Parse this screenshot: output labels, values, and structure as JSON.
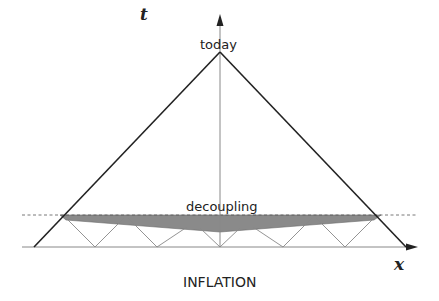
{
  "diagram": {
    "axes": {
      "t_label": "t",
      "x_label": "x"
    },
    "labels": {
      "today": "today",
      "decoupling": "decoupling",
      "caption": "INFLATION"
    },
    "colors": {
      "line": "#222222",
      "shaded_band": "#8a8a8a",
      "dashed_line": "#555555",
      "light_cones": "#888888",
      "background": "#ffffff"
    }
  }
}
